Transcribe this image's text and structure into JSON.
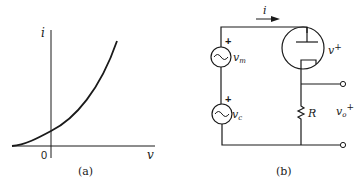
{
  "panel_a": {
    "y_axis_label": "i",
    "x_axis_label": "v",
    "origin_label": "0",
    "caption": "(a)",
    "curve_description": "monotonically increasing convex i-v characteristic, positive intercept at v=0"
  },
  "panel_b": {
    "current_label": "i",
    "source_top_label": "v",
    "source_top_subscript": "m",
    "source_top_polarity": "+",
    "source_bottom_label": "v",
    "source_bottom_subscript": "c",
    "source_bottom_polarity": "+",
    "tube_label": "v",
    "tube_superscript": "+",
    "resistor_label": "R",
    "output_label": "v",
    "output_subscript": "o",
    "output_superscript": "+",
    "caption": "(b)"
  }
}
